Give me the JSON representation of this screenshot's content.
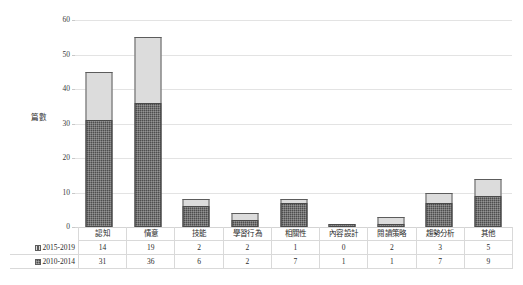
{
  "chart_data": {
    "type": "bar",
    "stacked": true,
    "title": "",
    "xlabel": "",
    "ylabel": "篇數",
    "ylim": [
      0,
      60
    ],
    "yticks": [
      0,
      10,
      20,
      30,
      40,
      50,
      60
    ],
    "grid": true,
    "legend_position": "table-left",
    "categories": [
      "認知",
      "情意",
      "技能",
      "學習行為",
      "相關性",
      "內容設計",
      "閱讀策略",
      "趨勢分析",
      "其他"
    ],
    "series": [
      {
        "name": "2015-2019",
        "values": [
          14,
          19,
          2,
          2,
          1,
          0,
          2,
          3,
          5
        ],
        "color": "#dcdcdc"
      },
      {
        "name": "2010-2014",
        "values": [
          31,
          36,
          6,
          2,
          7,
          1,
          1,
          7,
          9
        ],
        "color": "#4d4d4d"
      }
    ],
    "stack_totals": [
      45,
      55,
      8,
      4,
      8,
      1,
      3,
      10,
      14
    ]
  },
  "axis": {
    "tick_labels": [
      "60",
      "50",
      "40",
      "30",
      "20",
      "10",
      "0"
    ],
    "y_title": "篇數"
  },
  "table": {
    "row_labels": [
      "2015-2019",
      "2010-2014"
    ],
    "headers": [
      "認知",
      "情意",
      "技能",
      "學習行為",
      "相關性",
      "內容設計",
      "閱讀策略",
      "趨勢分析",
      "其他"
    ],
    "rows": [
      [
        "14",
        "19",
        "2",
        "2",
        "1",
        "0",
        "2",
        "3",
        "5"
      ],
      [
        "31",
        "36",
        "6",
        "2",
        "7",
        "1",
        "1",
        "7",
        "9"
      ]
    ]
  },
  "colors": {
    "series_2015_2019": "#dcdcdc",
    "series_2010_2014": "#4d4d4d",
    "gridline": "#e3e3e3",
    "border": "#5c5c5c",
    "background": "#ffffff"
  }
}
